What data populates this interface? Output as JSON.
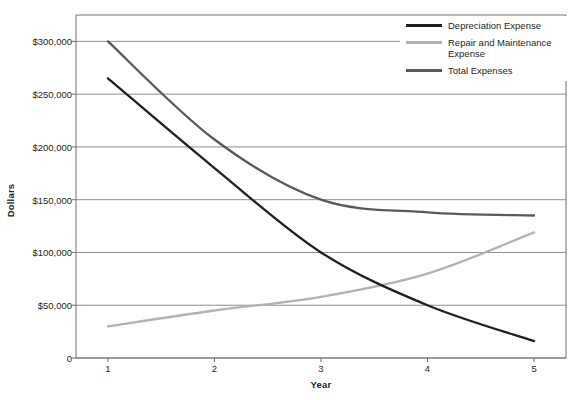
{
  "chart_data": {
    "type": "line",
    "title": "",
    "xlabel": "Year",
    "ylabel": "Dollars",
    "x": [
      1,
      2,
      3,
      4,
      5
    ],
    "categories": [
      "1",
      "2",
      "3",
      "4",
      "5"
    ],
    "xlim": [
      0.7,
      5.3
    ],
    "ylim": [
      0,
      325000
    ],
    "grid": true,
    "legend_position": "top-right",
    "y_tick_labels": [
      "$300,000",
      "$250,000",
      "$200,000",
      "$150,000",
      "$100,000",
      "$50,000",
      "0"
    ],
    "y_tick_values": [
      300000,
      250000,
      200000,
      150000,
      100000,
      50000,
      0
    ],
    "x_tick_labels": [
      "1",
      "2",
      "3",
      "4",
      "5"
    ],
    "series": [
      {
        "name": "Depreciation Expense",
        "color": "#231f20",
        "values": [
          265000,
          180000,
          100000,
          50000,
          16000
        ]
      },
      {
        "name": "Repair and Maintenance Expense",
        "color": "#b2b2b2",
        "values": [
          30000,
          45000,
          58000,
          80000,
          119000
        ]
      },
      {
        "name": "Total Expenses",
        "color": "#58595b",
        "values": [
          300000,
          207000,
          150000,
          138000,
          135000
        ]
      }
    ]
  },
  "legend": {
    "items": [
      {
        "label": "Depreciation Expense",
        "color": "#231f20"
      },
      {
        "label": "Repair and Maintenance Expense",
        "color": "#b2b2b2"
      },
      {
        "label": "Total Expenses",
        "color": "#58595b"
      }
    ]
  },
  "axes": {
    "y_title": "Dollars",
    "x_title": "Year"
  },
  "style": {
    "grid_color": "#808285",
    "axis_color": "#6d6e71",
    "plot_background": "#ffffff"
  }
}
